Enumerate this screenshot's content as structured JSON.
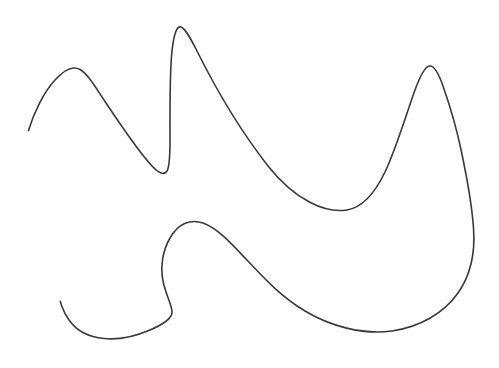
{
  "canvas": {
    "width": 499,
    "height": 368,
    "background_color": "#ffffff",
    "title": "Freeform Curve Sketch"
  },
  "drawing": {
    "name": "hand-drawn-freeform-curve",
    "type": "open-polycurve",
    "stroke_color": "#3a3a3a",
    "stroke_width": 1.6,
    "fill": "none",
    "stroke_linecap": "round",
    "stroke_linejoin": "round",
    "description": "Single continuous open hand-drawn wavy curve resembling a stylized bird or flame outline",
    "path_d": "M 28.5 130.5 C 34 112 44 92 55 80 C 64 70 73 65.5 80 69.5 C 88 74 96 88 106 103 C 120 124 138 151 152 166 C 159 173.5 164 175.5 167 171 C 169.5 167 170 156 170 140 C 170 110 169.5 74 172 51 C 174 33 177 25.5 181 27 C 185.5 28.5 190.5 38 198 53 C 214 85 240 130 268 166 C 295 200 325 213.5 347 210 C 362 207.5 374 195 385 172 C 396 149 406 115 415 90 C 420.5 75 425 66.5 429.5 66 C 434 65.5 438.5 73 443 86 C 450 106 457 130 461.5 152 C 467 178 472 206 473.5 228 C 475.5 255 470 276 458 293 C 444 313 420 327 392 331 C 362 335 330 326 305 311 C 280 296 262 276 245 258 C 230 242 217 228 203 223 C 190 218.5 178 224 170 238 C 163 250 160 266 163 281 C 166 296 173 307 172 313 C 171 319 163 324.5 150 330 C 136 336 118 340 104 338.5 C 88 337 76 330 69 320 C 62 310 60 300 60.5 301.5",
    "bounding_box": {
      "x": 28,
      "y": 26,
      "width": 447,
      "height": 314
    },
    "endpoints": [
      {
        "name": "start-endpoint-upper-left",
        "x": 28.5,
        "y": 130.5
      },
      {
        "name": "end-endpoint-lower-left",
        "x": 60.5,
        "y": 301.5
      }
    ],
    "key_points": [
      {
        "name": "first-peak-apex",
        "x": 78,
        "y": 69
      },
      {
        "name": "sharp-valley-bottom",
        "x": 166,
        "y": 173
      },
      {
        "name": "tall-peak-apex",
        "x": 179,
        "y": 27
      },
      {
        "name": "middle-valley-bottom",
        "x": 365,
        "y": 209
      },
      {
        "name": "right-peak-apex",
        "x": 427,
        "y": 65
      },
      {
        "name": "right-extreme",
        "x": 474,
        "y": 235
      },
      {
        "name": "lower-blob-bottom",
        "x": 382,
        "y": 331
      },
      {
        "name": "inner-arc-top",
        "x": 200,
        "y": 219
      },
      {
        "name": "inner-arc-left",
        "x": 116,
        "y": 241
      },
      {
        "name": "small-loop-right",
        "x": 172,
        "y": 312
      },
      {
        "name": "small-loop-bottom",
        "x": 133,
        "y": 338
      }
    ]
  }
}
